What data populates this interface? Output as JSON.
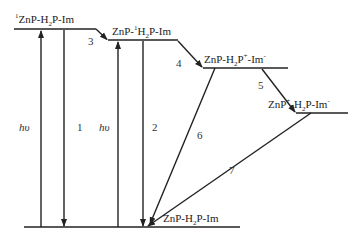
{
  "diagram": {
    "type": "energy-level (Jablonski-type) scheme",
    "states": [
      {
        "id": "s1",
        "prefix_sup": "1",
        "text_a": "ZnP-H",
        "sub": "2",
        "text_b": "P-Im"
      },
      {
        "id": "s2",
        "text_a": "ZnP-",
        "sup": "1",
        "text_b": "H",
        "sub": "2",
        "text_c": "P-Im"
      },
      {
        "id": "s3",
        "text_a": "ZnP-H",
        "sub": "2",
        "text_b": "P",
        "sup1": "+",
        "text_c": "-Im",
        "sup2": "-"
      },
      {
        "id": "s4",
        "text_a": "ZnP",
        "sup1": "+",
        "text_b": "-H",
        "sub": "2",
        "text_c": "P-Im",
        "sup2": "-"
      },
      {
        "id": "ground",
        "text_a": "ZnP-H",
        "sub": "2",
        "text_b": "P-Im"
      }
    ],
    "process_labels": [
      "1",
      "2",
      "3",
      "4",
      "5",
      "6",
      "7"
    ],
    "excitation_label": "hυ"
  }
}
